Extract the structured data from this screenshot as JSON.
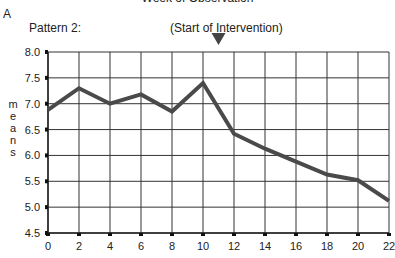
{
  "panel_letter": "A",
  "top_title": "Week of Observation",
  "pattern_label": "Pattern 2:",
  "annotation": {
    "label": "(Start of Intervention)",
    "x": 11,
    "marker": "down-triangle"
  },
  "ylabel_letters": [
    "m",
    "e",
    "a",
    "n",
    "s"
  ],
  "colors": {
    "line": "#4a4a4a",
    "grid": "#333333",
    "marker": "#444444"
  },
  "chart_data": {
    "type": "line",
    "title": "Week of Observation",
    "subtitle": "Pattern 2:",
    "xlabel": "Week of Observation",
    "ylabel": "means",
    "x": [
      0,
      2,
      4,
      6,
      8,
      10,
      12,
      14,
      16,
      18,
      20,
      22
    ],
    "series": [
      {
        "name": "means",
        "values": [
          6.88,
          7.3,
          7.0,
          7.18,
          6.85,
          7.4,
          6.42,
          6.13,
          5.88,
          5.63,
          5.52,
          5.12
        ]
      }
    ],
    "xticks": [
      0,
      2,
      4,
      6,
      8,
      10,
      12,
      14,
      16,
      18,
      20,
      22
    ],
    "yticks": [
      "4.5",
      "5.0",
      "5.5",
      "6.0",
      "6.5",
      "7.0",
      "7.5",
      "8.0"
    ],
    "xlim": [
      0,
      22
    ],
    "ylim": [
      4.5,
      8.0
    ],
    "grid": true,
    "annotations": [
      {
        "text": "(Start of Intervention)",
        "x": 11,
        "marker": "down-triangle"
      }
    ],
    "legend": null
  }
}
